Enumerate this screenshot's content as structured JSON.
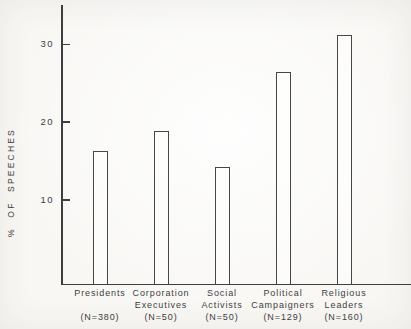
{
  "colors": {
    "ink": "#3e3e3e",
    "paper": "#f8f7f4",
    "bar_outline": "#474747",
    "bar_fill": "#ffffff"
  },
  "chart_data": {
    "type": "bar",
    "title": "",
    "xlabel": "",
    "ylabel": "% OF SPEECHES",
    "ylim": [
      0,
      35
    ],
    "yticks": [
      10,
      20,
      30
    ],
    "grid": false,
    "legend": false,
    "bar_style": "outlined-unfilled",
    "categories": [
      {
        "label_lines": [
          "Presidents"
        ],
        "n_label": "(N=380)",
        "value": 16.3
      },
      {
        "label_lines": [
          "Corporation",
          "Executives"
        ],
        "n_label": "(N=50)",
        "value": 18.8
      },
      {
        "label_lines": [
          "Social",
          "Activists"
        ],
        "n_label": "(N=50)",
        "value": 14.2
      },
      {
        "label_lines": [
          "Political",
          "Campaigners"
        ],
        "n_label": "(N=129)",
        "value": 26.4
      },
      {
        "label_lines": [
          "Religious",
          "Leaders"
        ],
        "n_label": "(N=160)",
        "value": 31.2
      }
    ]
  }
}
